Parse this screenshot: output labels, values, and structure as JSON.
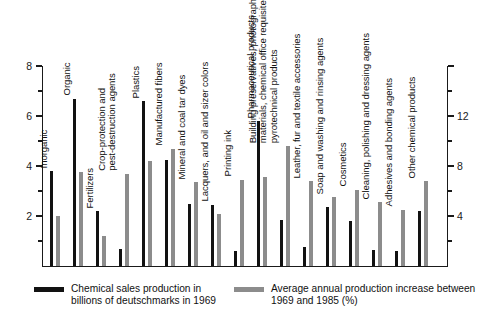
{
  "chart_data": {
    "type": "bar",
    "title": "",
    "xlabel": "",
    "ylabel": "",
    "y_left_label": "Chemical sales production in billions of deutschmarks in 1969",
    "y_right_label": "Average annual production increase between 1969 and 1985 (%)",
    "ylim": [
      0,
      8
    ],
    "y_right_lim": [
      0,
      16
    ],
    "y_left_ticks": [
      "2",
      "4",
      "6",
      "8"
    ],
    "y_left_tick_values": [
      2,
      4,
      6,
      8
    ],
    "y_right_ticks": [
      "4",
      "8",
      "12"
    ],
    "y_right_tick_values": [
      4,
      8,
      12
    ],
    "grid": false,
    "legend_position": "bottom",
    "categories": [
      "Inorganic",
      "Organic",
      "Fertilizers",
      "Crop-protection and pest-destruction agents",
      "Plastics",
      "Manufactured fibers",
      "Mineral and coal tar dyes",
      "Lacquers, and oil and sizer colors",
      "Printing ink",
      "Pharmaceutical products",
      "Building preservatives, photographic materials, chemical office requisites, pyrotechnical products",
      "Leather, fur and textile accessories",
      "Soap and washing and rinsing agents",
      "Cosmetics",
      "Cleaning, polishing and dressing agents",
      "Adhesives and bonding agents",
      "Other chemical products"
    ],
    "series": [
      {
        "name": "Chemical sales production in billions of deutschmarks in 1969",
        "axis": "left",
        "color": "#121212",
        "values": [
          3.8,
          6.7,
          2.2,
          0.7,
          6.6,
          4.25,
          2.5,
          2.45,
          0.6,
          5.8,
          1.85,
          0.75,
          2.35,
          1.8,
          0.65,
          0.6,
          2.2
        ]
      },
      {
        "name": "Average annual production increase between 1969 and 1985 (%)",
        "axis": "right",
        "color": "#8c8c8c",
        "values": [
          4.0,
          7.5,
          2.4,
          7.4,
          8.4,
          9.4,
          6.7,
          4.2,
          6.9,
          7.1,
          9.6,
          6.8,
          5.5,
          6.1,
          5.1,
          4.5,
          6.8
        ]
      }
    ]
  },
  "legend": {
    "items": [
      {
        "swatch": "black",
        "line1": "Chemical sales production in",
        "line2": "billions of deutschmarks in 1969"
      },
      {
        "swatch": "gray",
        "line1": "Average annual production increase between",
        "line2": "1969 and 1985 (%)"
      }
    ]
  },
  "category_label_lines": [
    [
      "Inorganic"
    ],
    [
      "Organic"
    ],
    [
      "Fertilizers"
    ],
    [
      "Crop-protection and",
      "pest-destruction agents"
    ],
    [
      "Plastics"
    ],
    [
      "Manufactured fibers"
    ],
    [
      "Mineral and coal tar dyes"
    ],
    [
      "Lacquers, and oil and sizer colors"
    ],
    [
      "Printing ink"
    ],
    [
      "Pharmaceutical products"
    ],
    [
      "Building preservatives, photographic",
      "materials, chemical office requisites,",
      "pyrotechnical products"
    ],
    [
      "Leather, fur and textile accessories"
    ],
    [
      "Soap and washing and rinsing agents"
    ],
    [
      "Cosmetics"
    ],
    [
      "Cleaning, polishing and dressing agents"
    ],
    [
      "Adhesives and bonding agents"
    ],
    [
      "Other chemical products"
    ]
  ]
}
